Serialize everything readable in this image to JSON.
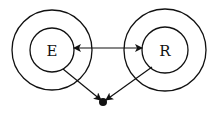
{
  "diagram": {
    "nodes": [
      {
        "id": "E",
        "label": "E",
        "cx": 52,
        "cy": 50,
        "outer_r": 40,
        "inner_r": 22
      },
      {
        "id": "R",
        "label": "R",
        "cx": 165,
        "cy": 50,
        "outer_r": 41,
        "inner_r": 23
      }
    ],
    "edges": [
      {
        "from": "E",
        "to": "R",
        "type": "bidirectional-arrow"
      },
      {
        "from": "E",
        "to": "sink",
        "type": "arrow"
      },
      {
        "from": "R",
        "to": "sink",
        "type": "arrow"
      }
    ],
    "sink": {
      "cx": 103,
      "cy": 102,
      "r": 4
    },
    "colors": {
      "stroke": "#111111",
      "background": "#ffffff"
    }
  }
}
